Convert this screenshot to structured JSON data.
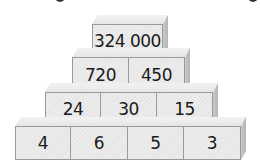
{
  "pyramid": {
    "rows": [
      {
        "level": 1,
        "cells": [
          "324 000"
        ]
      },
      {
        "level": 2,
        "cells": [
          "720",
          "450"
        ]
      },
      {
        "level": 3,
        "cells": [
          "24",
          "30",
          "15"
        ]
      },
      {
        "level": 4,
        "cells": [
          "4",
          "6",
          "5",
          "3"
        ]
      }
    ]
  },
  "colors": {
    "block_face": "#e8e8e8",
    "block_side": "#bdbdbd",
    "block_border": "#9a9a9a",
    "text": "#1a1a1a"
  }
}
